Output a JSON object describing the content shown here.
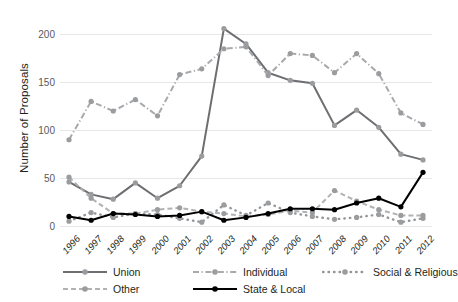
{
  "chart_data": {
    "type": "line",
    "title": "",
    "xlabel": "",
    "ylabel": "Number of Proposals",
    "ylim": [
      0,
      215
    ],
    "yticks": [
      0,
      50,
      100,
      150,
      200
    ],
    "grid": true,
    "legend_position": "bottom",
    "x": [
      1996,
      1997,
      1998,
      1999,
      2000,
      2001,
      2002,
      2003,
      2004,
      2005,
      2006,
      2007,
      2008,
      2009,
      2010,
      2011,
      2012
    ],
    "categories": [
      "1996",
      "1997",
      "1998",
      "1999",
      "2000",
      "2001",
      "2002",
      "2003",
      "2004",
      "2005",
      "2006",
      "2007",
      "2008",
      "2009",
      "2010",
      "2011",
      "2012"
    ],
    "series": [
      {
        "name": "Union",
        "color": "#6d6e71",
        "dash": "solid",
        "values": [
          46,
          33,
          28,
          45,
          29,
          42,
          73,
          206,
          190,
          160,
          152,
          149,
          105,
          121,
          103,
          75,
          69
        ]
      },
      {
        "name": "Individual",
        "color": "#a7a9ac",
        "dash": "dashdot",
        "values": [
          90,
          130,
          120,
          132,
          115,
          158,
          164,
          185,
          187,
          157,
          180,
          178,
          160,
          180,
          159,
          118,
          106
        ]
      },
      {
        "name": "Social & Religious",
        "color": "#939598",
        "dash": "dotted",
        "values": [
          5,
          14,
          9,
          13,
          12,
          8,
          4,
          22,
          11,
          24,
          14,
          10,
          7,
          9,
          12,
          4,
          8
        ]
      },
      {
        "name": "Other",
        "color": "#b0b2b4",
        "dash": "dashed",
        "values": [
          51,
          29,
          13,
          13,
          17,
          19,
          15,
          13,
          10,
          12,
          16,
          14,
          37,
          26,
          17,
          11,
          11
        ]
      },
      {
        "name": "State & Local",
        "color": "#000000",
        "dash": "solid",
        "values": [
          10,
          6,
          13,
          12,
          10,
          11,
          15,
          6,
          9,
          13,
          18,
          18,
          17,
          24,
          29,
          20,
          56
        ]
      }
    ]
  },
  "legend": {
    "rows": [
      [
        {
          "label": "Union",
          "series": 0
        },
        {
          "label": "Individual",
          "series": 1
        },
        {
          "label": "Social & Religious",
          "series": 2
        }
      ],
      [
        {
          "label": "Other",
          "series": 3
        },
        {
          "label": "State & Local",
          "series": 4
        }
      ]
    ]
  }
}
